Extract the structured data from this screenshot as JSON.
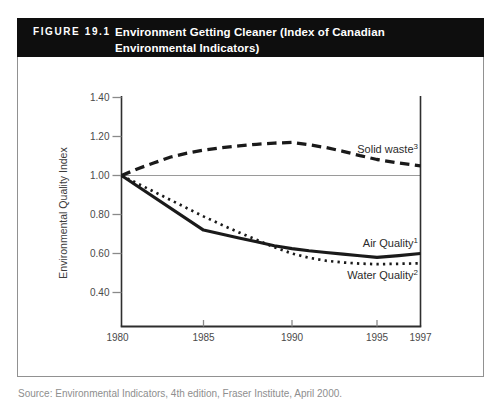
{
  "figure": {
    "label": "FIGURE 19.1",
    "title_line1": "Environment Getting Cleaner (Index of Canadian",
    "title_line2": "Environmental Indicators)"
  },
  "source": "Source: Environmental Indicators, 4th edition, Fraser Institute, April 2000.",
  "colors": {
    "header_bg": "#0e0e0e",
    "header_text": "#ffffff",
    "figure_border": "#919191",
    "axis": "#2e2e2e",
    "tick": "#8a8a8a",
    "tick_text": "#4a4a4a",
    "reference_line": "#9a9a9a",
    "series_line": "#1a1a1a",
    "series_label_text": "#2b2b2b"
  },
  "chart_data": {
    "type": "line",
    "title": "Environment Getting Cleaner (Index of Canadian Environmental Indicators)",
    "xlabel": "",
    "ylabel": "Environmental Quality Index",
    "xlim": [
      1980,
      1997
    ],
    "ylim": [
      0.23,
      1.41
    ],
    "grid": false,
    "legend_position": "inline-right",
    "reference_line_value": 1.0,
    "yticks": [
      {
        "label": "1.40",
        "value": 1.4
      },
      {
        "label": "1.20",
        "value": 1.2
      },
      {
        "label": "1.00",
        "value": 1.0
      },
      {
        "label": "0.80",
        "value": 0.8
      },
      {
        "label": "0.60",
        "value": 0.6
      },
      {
        "label": "0.40",
        "value": 0.4
      }
    ],
    "xticks": [
      {
        "label": "1980",
        "value": 1980
      },
      {
        "label": "1985",
        "value": 1985
      },
      {
        "label": "1990",
        "value": 1990
      },
      {
        "label": "1995",
        "value": 1995
      },
      {
        "label": "1997",
        "value": 1997
      }
    ],
    "series": [
      {
        "name": "Solid waste",
        "sup": "3",
        "style": "dashed",
        "points": [
          [
            1980,
            1.0
          ],
          [
            1981,
            1.035
          ],
          [
            1982,
            1.065
          ],
          [
            1983,
            1.095
          ],
          [
            1984,
            1.115
          ],
          [
            1985,
            1.13
          ],
          [
            1986,
            1.142
          ],
          [
            1987,
            1.152
          ],
          [
            1988,
            1.16
          ],
          [
            1989,
            1.166
          ],
          [
            1990,
            1.17
          ],
          [
            1991,
            1.158
          ],
          [
            1992,
            1.143
          ],
          [
            1993,
            1.124
          ],
          [
            1994,
            1.102
          ],
          [
            1995,
            1.082
          ],
          [
            1996,
            1.064
          ],
          [
            1997,
            1.05
          ]
        ]
      },
      {
        "name": "Air Quality",
        "sup": "1",
        "style": "solid",
        "points": [
          [
            1980,
            1.0
          ],
          [
            1985,
            0.72
          ],
          [
            1986,
            0.7
          ],
          [
            1987,
            0.68
          ],
          [
            1988,
            0.66
          ],
          [
            1989,
            0.64
          ],
          [
            1990,
            0.625
          ],
          [
            1991,
            0.614
          ],
          [
            1992,
            0.605
          ],
          [
            1993,
            0.597
          ],
          [
            1994,
            0.588
          ],
          [
            1995,
            0.58
          ],
          [
            1996,
            0.589
          ],
          [
            1997,
            0.6
          ]
        ]
      },
      {
        "name": "Water Quality",
        "sup": "2",
        "style": "dotted",
        "points": [
          [
            1980,
            1.0
          ],
          [
            1985,
            0.79
          ],
          [
            1986,
            0.748
          ],
          [
            1987,
            0.708
          ],
          [
            1988,
            0.67
          ],
          [
            1989,
            0.632
          ],
          [
            1990,
            0.6
          ],
          [
            1991,
            0.578
          ],
          [
            1992,
            0.563
          ],
          [
            1993,
            0.554
          ],
          [
            1994,
            0.548
          ],
          [
            1995,
            0.545
          ],
          [
            1996,
            0.547
          ],
          [
            1997,
            0.55
          ]
        ]
      }
    ]
  }
}
